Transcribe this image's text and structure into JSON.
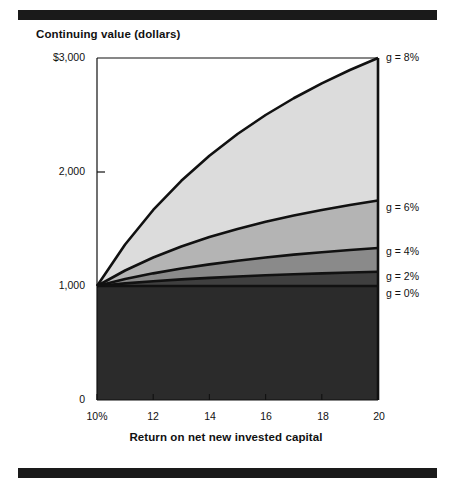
{
  "figure": {
    "title": "Continuing value (dollars)",
    "x_axis_title": "Return on net new invested capital"
  },
  "rules": {
    "top": "top-rule",
    "bottom": "bottom-rule"
  },
  "chart_data": {
    "type": "area",
    "title": "Continuing value (dollars)",
    "xlabel": "Return on net new invested capital",
    "ylabel": "Continuing value (dollars)",
    "xlim": [
      10,
      20
    ],
    "ylim": [
      0,
      3000
    ],
    "grid": false,
    "legend_position": "right-of-plot-at-series-end",
    "x_tick_labels": [
      "10%",
      "12",
      "14",
      "16",
      "18",
      "20"
    ],
    "x_ticks": [
      10,
      12,
      14,
      16,
      18,
      20
    ],
    "y_tick_labels": [
      "$3,000",
      "2,000",
      "1,000",
      "0"
    ],
    "y_ticks": [
      3000,
      2000,
      1000,
      0
    ],
    "x": [
      10,
      11,
      12,
      13,
      14,
      15,
      16,
      17,
      18,
      19,
      20
    ],
    "series": [
      {
        "name": "g = 0%",
        "label": "g = 0%",
        "fill": "#2b2b2b",
        "values": [
          1000,
          1000,
          1000,
          1000,
          1000,
          1000,
          1000,
          1000,
          1000,
          1000,
          1000
        ]
      },
      {
        "name": "g = 2%",
        "label": "g = 2%",
        "fill": "#3f3f3f",
        "values": [
          1000,
          1023,
          1042,
          1058,
          1071,
          1083,
          1094,
          1103,
          1111,
          1118,
          1125
        ]
      },
      {
        "name": "g = 4%",
        "label": "g = 4%",
        "fill": "#8a8a8a",
        "values": [
          1000,
          1061,
          1111,
          1154,
          1190,
          1222,
          1250,
          1275,
          1296,
          1316,
          1333
        ]
      },
      {
        "name": "g = 6%",
        "label": "g = 6%",
        "fill": "#b4b4b4",
        "values": [
          1000,
          1136,
          1250,
          1346,
          1429,
          1500,
          1563,
          1618,
          1667,
          1711,
          1750
        ]
      },
      {
        "name": "g = 8%",
        "label": "g = 8%",
        "fill": "#dcdcdc",
        "values": [
          1000,
          1364,
          1667,
          1923,
          2143,
          2333,
          2500,
          2647,
          2778,
          2895,
          3000
        ]
      }
    ],
    "series_end_values": {
      "g = 0%": 1000,
      "g = 2%": 1125,
      "g = 4%": 1333,
      "g = 6%": 1750,
      "g = 8%": 3000
    }
  },
  "legend": {
    "items": [
      {
        "label": "g = 8%"
      },
      {
        "label": "g = 6%"
      },
      {
        "label": "g = 4%"
      },
      {
        "label": "g = 2%"
      },
      {
        "label": "g = 0%"
      }
    ]
  }
}
